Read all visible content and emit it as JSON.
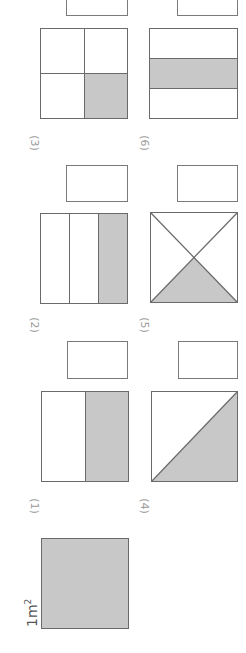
{
  "worksheet": {
    "orientation": "rotated 90 degrees",
    "reference": {
      "label": "1m",
      "exponent": "2",
      "shaded": "full square"
    },
    "problems": [
      {
        "number": "(1)",
        "figure": "square divided into 2 equal parts, 1 shaded",
        "answer": ""
      },
      {
        "number": "(2)",
        "figure": "square divided into 3 equal strips, 1 shaded",
        "answer": ""
      },
      {
        "number": "(3)",
        "figure": "square divided into 4 equal quarters, 1 shaded",
        "answer": ""
      },
      {
        "number": "(4)",
        "figure": "square split by a diagonal, 1 triangle shaded",
        "answer": ""
      },
      {
        "number": "(5)",
        "figure": "square split by both diagonals into 4 triangles, 1 shaded",
        "answer": ""
      },
      {
        "number": "(6)",
        "figure": "square divided into 3 equal bands, middle band shaded",
        "answer": ""
      }
    ]
  },
  "colors": {
    "shade": "#c8c8c8",
    "border": "#6a6a6a",
    "label": "#9a9a9a"
  }
}
